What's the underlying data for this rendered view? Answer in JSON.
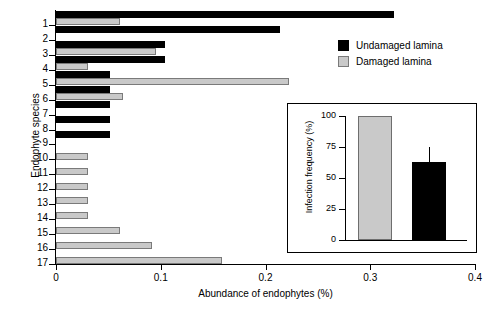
{
  "chart_data": {
    "type": "bar",
    "orientation": "horizontal",
    "title": "",
    "xlabel": "Abundance of endophytes (%)",
    "ylabel": "Endophyte species",
    "xlim": [
      0,
      0.4
    ],
    "xticks": [
      "0",
      "0.1",
      "0.2",
      "0.3",
      "0.4"
    ],
    "xtick_values": [
      0,
      0.1,
      0.2,
      0.3,
      0.4
    ],
    "categories": [
      "1",
      "2",
      "3",
      "4",
      "5",
      "6",
      "7",
      "8",
      "9",
      "10",
      "11",
      "12",
      "13",
      "14",
      "15",
      "16",
      "17"
    ],
    "grid": false,
    "legend_position": "upper right",
    "series": [
      {
        "name": "Undamaged lamina",
        "color": "#000000",
        "values": [
          0.323,
          0.214,
          0.104,
          0.104,
          0.052,
          0.052,
          0.052,
          0.052,
          0.052,
          0,
          0,
          0,
          0,
          0,
          0,
          0,
          0
        ]
      },
      {
        "name": "Damaged lamina",
        "color": "#c9c9c9",
        "values": [
          0.061,
          0,
          0.095,
          0.031,
          0.222,
          0.064,
          0,
          0,
          0,
          0.031,
          0.031,
          0.031,
          0.031,
          0.031,
          0.061,
          0.092,
          0.158
        ]
      }
    ]
  },
  "legend": {
    "items": [
      {
        "label": "Undamaged lamina",
        "swatch": "black"
      },
      {
        "label": "Damaged lamina",
        "swatch": "gray"
      }
    ]
  },
  "inset": {
    "chart_data": {
      "type": "bar",
      "ylabel": "Infection frequency (%)",
      "xlabel": "",
      "ylim": [
        0,
        100
      ],
      "yticks": [
        "0",
        "25",
        "50",
        "75",
        "100"
      ],
      "ytick_values": [
        0,
        25,
        50,
        75,
        100
      ],
      "categories": [
        "Damaged lamina",
        "Undamaged lamina"
      ],
      "values": [
        100,
        63
      ],
      "errors": [
        0,
        12
      ],
      "colors": [
        "#c9c9c9",
        "#000000"
      ]
    }
  }
}
